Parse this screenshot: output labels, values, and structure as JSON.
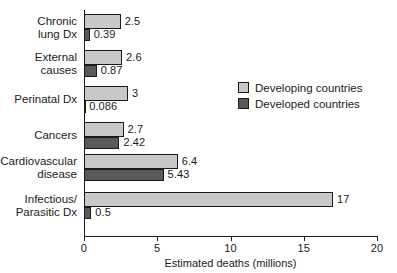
{
  "chart_data": {
    "type": "bar",
    "orientation": "horizontal",
    "grouped": true,
    "title": "",
    "xlabel": "Estimated deaths (millions)",
    "ylabel": "",
    "xlim": [
      0,
      20
    ],
    "xticks": [
      0,
      5,
      10,
      15,
      20
    ],
    "xtick_labels": [
      "0",
      "5",
      "10",
      "15",
      "20"
    ],
    "grid": false,
    "legend_position": "center-right",
    "categories": [
      "Chronic\nlung Dx",
      "External\ncauses",
      "Perinatal Dx",
      "Cancers",
      "Cardiovascular\ndisease",
      "Infectious/\nParasitic Dx"
    ],
    "series": [
      {
        "name": "Developing countries",
        "color": "#c8c8c8",
        "values": [
          2.5,
          2.6,
          3,
          2.7,
          6.4,
          17
        ],
        "value_labels": [
          "2.5",
          "2.6",
          "3",
          "2.7",
          "6.4",
          "17"
        ]
      },
      {
        "name": "Developed countries",
        "color": "#5a5a5a",
        "values": [
          0.39,
          0.87,
          0.086,
          2.42,
          5.43,
          0.5
        ],
        "value_labels": [
          "0.39",
          "0.87",
          "0.086",
          "2.42",
          "5.43",
          "0.5"
        ]
      }
    ]
  },
  "legend": {
    "items": [
      {
        "label": "Developing countries",
        "color": "#c8c8c8"
      },
      {
        "label": "Developed countries",
        "color": "#5a5a5a"
      }
    ]
  },
  "axis": {
    "x_title": "Estimated deaths (millions)",
    "ticks": [
      "0",
      "5",
      "10",
      "15",
      "20"
    ]
  },
  "colors": {
    "developing": "#c8c8c8",
    "developed": "#5a5a5a",
    "line": "#1a1a1a",
    "background": "#ffffff"
  }
}
